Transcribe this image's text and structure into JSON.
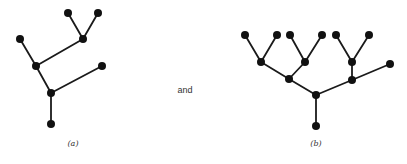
{
  "connector_text": "and",
  "trees": [
    {
      "label": "(a)",
      "label_pos": [
        73,
        145
      ],
      "nodes": [
        [
          68,
          13
        ],
        [
          98,
          13
        ],
        [
          83,
          39
        ],
        [
          20,
          39
        ],
        [
          36,
          66
        ],
        [
          102,
          66
        ],
        [
          51,
          93
        ],
        [
          51,
          124
        ]
      ],
      "edges": [
        [
          0,
          2
        ],
        [
          1,
          2
        ],
        [
          2,
          4
        ],
        [
          3,
          4
        ],
        [
          4,
          6
        ],
        [
          5,
          6
        ],
        [
          6,
          7
        ]
      ]
    },
    {
      "label": "(b)",
      "label_pos": [
        316,
        145
      ],
      "nodes": [
        [
          245,
          35
        ],
        [
          277,
          35
        ],
        [
          290,
          35
        ],
        [
          322,
          35
        ],
        [
          336,
          35
        ],
        [
          369,
          35
        ],
        [
          261,
          62
        ],
        [
          305,
          62
        ],
        [
          352,
          62
        ],
        [
          390,
          64
        ],
        [
          289,
          79
        ],
        [
          352,
          80
        ],
        [
          316,
          95
        ],
        [
          316,
          126
        ]
      ],
      "edges": [
        [
          0,
          6
        ],
        [
          1,
          6
        ],
        [
          2,
          7
        ],
        [
          3,
          7
        ],
        [
          4,
          8
        ],
        [
          5,
          8
        ],
        [
          6,
          10
        ],
        [
          7,
          10
        ],
        [
          8,
          11
        ],
        [
          9,
          11
        ],
        [
          10,
          12
        ],
        [
          11,
          12
        ],
        [
          12,
          13
        ]
      ]
    }
  ],
  "style": {
    "node_color": "#111111",
    "edge_color": "#1a1a1a",
    "node_radius": 4
  }
}
